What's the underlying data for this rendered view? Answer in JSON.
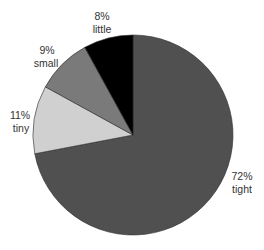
{
  "chart_data": {
    "type": "pie",
    "title": "",
    "start_angle_deg": 0,
    "direction": "clockwise",
    "categories": [
      "tight",
      "tiny",
      "small",
      "little"
    ],
    "values": [
      72,
      11,
      9,
      8
    ],
    "unit": "%",
    "colors": [
      "#505050",
      "#d0d0d0",
      "#7a7a7a",
      "#000000"
    ],
    "labels": [
      {
        "category": "tight",
        "percent": "72%",
        "name": "tight"
      },
      {
        "category": "tiny",
        "percent": "11%",
        "name": "tiny"
      },
      {
        "category": "small",
        "percent": "9%",
        "name": "small"
      },
      {
        "category": "little",
        "percent": "8%",
        "name": "little"
      }
    ],
    "legend": "none (labels placed outside slices)"
  }
}
